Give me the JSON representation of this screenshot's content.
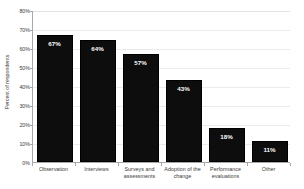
{
  "chart_data": {
    "type": "bar",
    "title": "",
    "xlabel": "",
    "ylabel": "Percent of respondents",
    "categories": [
      "Observation",
      "Interviews",
      "Surveys and assessments",
      "Adoption of the change",
      "Performance evaluations",
      "Other"
    ],
    "values": [
      67,
      64,
      57,
      43,
      18,
      11
    ],
    "data_labels": [
      "67%",
      "64%",
      "57%",
      "43%",
      "18%",
      "11%"
    ],
    "ylim": [
      0,
      80
    ],
    "ytick_values": [
      0,
      10,
      20,
      30,
      40,
      50,
      60,
      70,
      80
    ],
    "ytick_labels": [
      "0%",
      "10%",
      "20%",
      "30%",
      "40%",
      "50%",
      "60%",
      "70%",
      "80%"
    ],
    "grid": true,
    "legend": false,
    "bar_color": "#0d0d0d",
    "label_color": "#ffffff",
    "gridline_color": "#ebebeb",
    "axis_color": "#a8a8a8",
    "background": "#ffffff"
  }
}
